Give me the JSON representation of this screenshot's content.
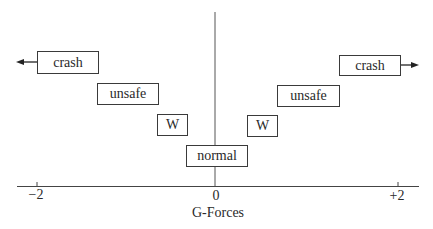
{
  "diagram": {
    "x_axis": {
      "title": "G-Forces",
      "ticks": [
        {
          "value": -2,
          "label": "−2"
        },
        {
          "value": 0,
          "label": "0"
        },
        {
          "value": 2,
          "label": "+2"
        }
      ]
    },
    "regions": {
      "crash_left": "crash",
      "unsafe_left": "unsafe",
      "warning_left": "W",
      "normal": "normal",
      "warning_right": "W",
      "unsafe_right": "unsafe",
      "crash_right": "crash"
    },
    "arrows": {
      "left": "arrow-left",
      "right": "arrow-right"
    },
    "colors": {
      "line": "#3a3a3a",
      "text": "#2a2a2a",
      "background": "#ffffff"
    }
  }
}
